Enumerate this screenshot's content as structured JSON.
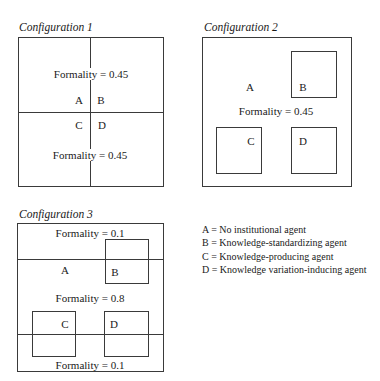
{
  "configurations": [
    {
      "caption": "Configuration 1",
      "formality_top": "Formality = 0.45",
      "formality_bottom": "Formality = 0.45",
      "labels": {
        "A": "A",
        "B": "B",
        "C": "C",
        "D": "D"
      }
    },
    {
      "caption": "Configuration 2",
      "formality": "Formality = 0.45",
      "labels": {
        "A": "A",
        "B": "B",
        "C": "C",
        "D": "D"
      }
    },
    {
      "caption": "Configuration 3",
      "formality_top": "Formality = 0.1",
      "formality_middle": "Formality = 0.8",
      "formality_bottom": "Formality = 0.1",
      "labels": {
        "A": "A",
        "B": "B",
        "C": "C",
        "D": "D"
      }
    }
  ],
  "legend": [
    "A = No institutional agent",
    "B = Knowledge-standardizing agent",
    "C = Knowledge-producing agent",
    "D = Knowledge variation-inducing agent"
  ]
}
